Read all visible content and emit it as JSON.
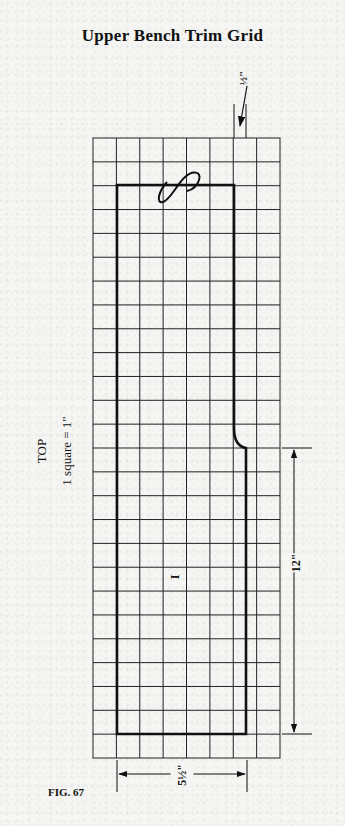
{
  "title": "Upper Bench Trim Grid",
  "labels": {
    "view": "TOP",
    "scale": "1 square = 1\"",
    "part_number": "I",
    "figure": "FIG. 67"
  },
  "dimensions": {
    "offset": "½\"",
    "height": "12\"",
    "width": "5½\""
  },
  "grid": {
    "columns": 8,
    "rows": 26,
    "unit": "1 square = 1 inch"
  },
  "colors": {
    "ink": "#111111",
    "paper": "#f5f5f3"
  }
}
